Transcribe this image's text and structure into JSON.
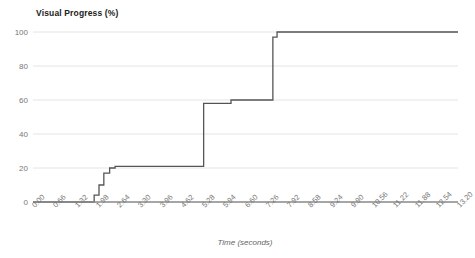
{
  "chart_data": {
    "type": "line",
    "title": "Visual Progress (%)",
    "xlabel": "Time (seconds)",
    "ylabel": "",
    "xlim": [
      0.0,
      13.2
    ],
    "ylim": [
      0,
      100
    ],
    "grid": true,
    "legend": "none",
    "line_color": "#555555",
    "step": "post",
    "yticks": [
      0,
      20,
      40,
      60,
      80,
      100
    ],
    "ytick_labels": [
      "0",
      "20",
      "40",
      "60",
      "80",
      "100"
    ],
    "xticks": [
      0.0,
      0.66,
      1.32,
      1.98,
      2.64,
      3.3,
      3.96,
      4.62,
      5.28,
      5.94,
      6.6,
      7.26,
      7.92,
      8.58,
      9.24,
      9.9,
      10.56,
      11.22,
      11.88,
      12.54,
      13.2
    ],
    "xtick_labels": [
      "0.00",
      "0.66",
      "1.32",
      "1.98",
      "2.64",
      "3.30",
      "3.96",
      "4.62",
      "5.28",
      "5.94",
      "6.60",
      "7.26",
      "7.92",
      "8.58",
      "9.24",
      "9.90",
      "10.56",
      "11.22",
      "11.88",
      "12.54",
      "13.20"
    ],
    "series": [
      {
        "name": "Visual Progress",
        "x": [
          0.0,
          1.9,
          1.9,
          2.05,
          2.05,
          2.2,
          2.2,
          2.38,
          2.38,
          2.55,
          2.55,
          5.3,
          5.3,
          6.15,
          6.15,
          7.45,
          7.45,
          7.58,
          7.58,
          13.2
        ],
        "y": [
          0,
          0,
          4,
          4,
          10,
          10,
          17,
          17,
          20,
          20,
          21,
          21,
          58,
          58,
          60,
          60,
          97,
          97,
          100,
          100
        ]
      }
    ],
    "annotations": []
  }
}
